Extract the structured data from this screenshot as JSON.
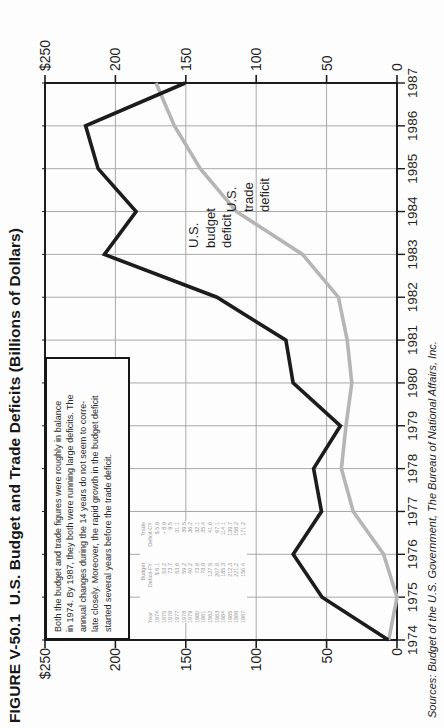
{
  "title": "FIGURE V-50.1  U.S. Budget and Trade Deficits (Billions of Dollars)",
  "source_citation": "Sources: Budget of the U.S. Government, The Bureau of National Affairs, Inc.",
  "annotation": {
    "lines": [
      "Both the budget and trade figures were roughly in balance",
      "in 1974. By 1987, they both were running large deficits. The",
      "annual changes during the 14 years do not seem to corre-",
      "late closely. Moreover, the rapid growth in the budget deficit",
      "started several years before the trade deficit."
    ]
  },
  "line_labels": {
    "budget": [
      "U.S.",
      "budget",
      "deficit"
    ],
    "trade": [
      "U.S.",
      "trade",
      "deficit"
    ]
  },
  "y_axis": {
    "tick_labels": [
      "$250",
      "200",
      "150",
      "100",
      "50",
      "0"
    ],
    "tick_values": [
      250,
      200,
      150,
      100,
      50,
      0
    ]
  },
  "x_axis": {
    "tick_labels": [
      "1974",
      "1975",
      "1976",
      "1977",
      "1978",
      "1979",
      "1980",
      "1981",
      "1982",
      "1983",
      "1984",
      "1985",
      "1986",
      "1987"
    ]
  },
  "colors": {
    "budget_line": "#1c1c1c",
    "trade_line": "#b5b5b5",
    "grid": "#a8a8a8",
    "frame": "#1c1c1c",
    "table_text": "#9a9a9a"
  },
  "chart_data": {
    "type": "line",
    "title": "U.S. Budget and Trade Deficits (Billions of Dollars)",
    "categories": [
      "1974",
      "1975",
      "1976",
      "1977",
      "1978",
      "1979",
      "1980",
      "1981",
      "1982",
      "1983",
      "1984",
      "1985",
      "1986",
      "1987"
    ],
    "series": [
      {
        "name": "U.S. budget deficit",
        "color": "#1c1c1c",
        "values": [
          6.1,
          53.2,
          73.7,
          53.6,
          59.2,
          40.2,
          73.8,
          78.9,
          127.9,
          207.8,
          185.3,
          212.3,
          221.2,
          150.4
        ]
      },
      {
        "name": "U.S. trade deficit",
        "color": "#b5b5b5",
        "values": [
          5.9,
          -8.9,
          9.5,
          31.1,
          39.5,
          36.2,
          32.1,
          35.4,
          41.6,
          67.1,
          114.1,
          139.7,
          158.2,
          171.2
        ]
      }
    ],
    "ylim": [
      0,
      250
    ],
    "ylabel": "Billions of Dollars",
    "grid": true,
    "legend_position": "inline-labels"
  },
  "inset_table": {
    "headers": {
      "year": "Year",
      "budget": [
        "Budget",
        "Deficit-FY"
      ],
      "trade": [
        "Trade",
        "Deficit-CY"
      ]
    },
    "rows": [
      [
        "1974",
        "$  6.1",
        "$  5.9"
      ],
      [
        "1975",
        "53.2",
        "+  8.9"
      ],
      [
        "1976",
        "73.7",
        "9.5"
      ],
      [
        "1977",
        "53.6",
        "31.1"
      ],
      [
        "1978",
        "59.2",
        "39.5"
      ],
      [
        "1979",
        "40.2",
        "36.2"
      ],
      [
        "1980",
        "73.8",
        "32.1"
      ],
      [
        "1981",
        "78.9",
        "35.4"
      ],
      [
        "1982",
        "127.9",
        "41.6"
      ],
      [
        "1983",
        "207.8",
        "67.1"
      ],
      [
        "1984",
        "185.3",
        "114.1"
      ],
      [
        "1985",
        "212.3",
        "139.7"
      ],
      [
        "1986",
        "221.2",
        "158.2"
      ],
      [
        "1987",
        "150.4",
        "171.2"
      ]
    ]
  }
}
